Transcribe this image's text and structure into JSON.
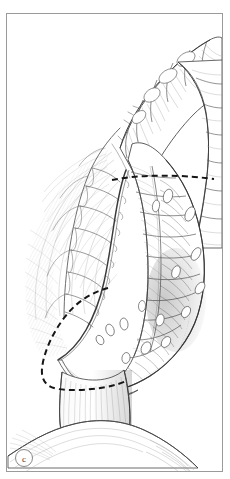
{
  "figure": {
    "panel_label": "c",
    "caption_visible": false,
    "background_color": "#ffffff",
    "ink_color": "#4a4a4a",
    "frame_color": "#9a9a9a",
    "dash_color": "#1a1a1a",
    "medium": "pen-and-ink line drawing"
  },
  "frame": {
    "x": 6,
    "y": 13,
    "width": 217,
    "height": 459,
    "border_width_px": 1
  },
  "structures": [
    {
      "name": "transverse-colon",
      "description": "haustrated bowel loop entering from upper right",
      "region": "top-right"
    },
    {
      "name": "descending-colon",
      "description": "haustrated bowel running vertically down the centre",
      "region": "centre"
    },
    {
      "name": "sigmoid-colon",
      "description": "bowel loop curving toward lower left",
      "region": "lower-centre"
    },
    {
      "name": "rectum",
      "description": "smooth tubular segment below sigmoid",
      "region": "bottom-centre"
    },
    {
      "name": "mesentery",
      "description": "fan of fine hatching with branching vessel arcades",
      "region": "left"
    },
    {
      "name": "marginal-artery",
      "description": "continuous vessel arcade running parallel to bowel wall",
      "region": "left-of-colon"
    },
    {
      "name": "appendices-epiploicae",
      "description": "small fatty tags along the antimesenteric border",
      "region": "right-of-colon"
    },
    {
      "name": "pelvic-floor",
      "description": "dome-shaped smooth structure at base",
      "region": "bottom"
    }
  ],
  "resection_lines": [
    {
      "name": "proximal-resection-line",
      "style": "dashed",
      "orientation": "horizontal",
      "description": "upper transection marker across the colon"
    },
    {
      "name": "distal-resection-line",
      "style": "dashed",
      "orientation": "curved",
      "description": "lower transection marker arcing around the distal bowel"
    }
  ]
}
